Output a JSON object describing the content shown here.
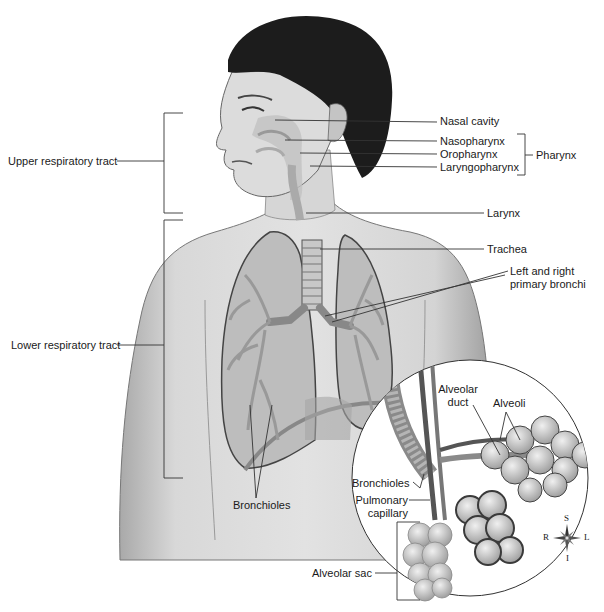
{
  "figure": {
    "colors": {
      "background": "#ffffff",
      "skin": "#cfcfcf",
      "hair": "#1c1c1c",
      "lines": "#333333",
      "lung": "#b9b9b9"
    }
  },
  "labels": {
    "upper_tract": "Upper respiratory tract",
    "lower_tract": "Lower respiratory tract",
    "nasal_cavity": "Nasal cavity",
    "nasopharynx": "Nasopharynx",
    "oropharynx": "Oropharynx",
    "laryngopharynx": "Laryngopharynx",
    "pharynx": "Pharynx",
    "larynx": "Larynx",
    "trachea": "Trachea",
    "bronchi_line1": "Left and right",
    "bronchi_line2": "primary bronchi",
    "bronchioles_main": "Bronchioles",
    "alveolar_duct_line1": "Alveolar",
    "alveolar_duct_line2": "duct",
    "alveoli": "Alveoli",
    "bronchioles_inset": "Bronchioles",
    "pulmonary_capillary_line1": "Pulmonary",
    "pulmonary_capillary_line2": "capillary",
    "alveolar_sac": "Alveolar sac"
  },
  "compass": {
    "superior": "S",
    "inferior": "I",
    "right": "R",
    "left": "L"
  }
}
